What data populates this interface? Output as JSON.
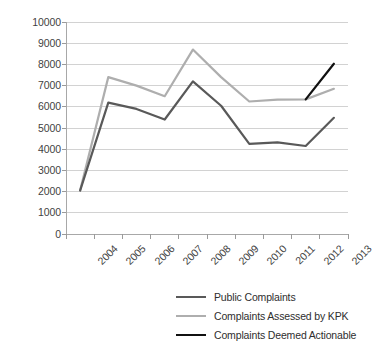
{
  "chart_data": {
    "type": "line",
    "title": "",
    "subtitle": "",
    "xlabel": "",
    "ylabel": "",
    "categories": [
      "2004",
      "2005",
      "2006",
      "2007",
      "2008",
      "2009",
      "2010",
      "2011",
      "2012",
      "2013"
    ],
    "ylim": [
      0,
      10000
    ],
    "ytick_step": 1000,
    "yticks": [
      "10000",
      "9000",
      "8000",
      "7000",
      "6000",
      "5000",
      "4000",
      "3000",
      "2000",
      "1000",
      "0"
    ],
    "ytick_values": [
      10000,
      9000,
      8000,
      7000,
      6000,
      5000,
      4000,
      3000,
      2000,
      1000,
      0
    ],
    "grid": "horizontal",
    "legend_position": "bottom",
    "series": [
      {
        "name": "Public Complaints",
        "color": "#595959",
        "width": 2.2,
        "values": [
          2050,
          6200,
          5900,
          5400,
          7200,
          6050,
          4250,
          4320,
          4150,
          5480
        ]
      },
      {
        "name": "Complaints Assessed by KPK",
        "color": "#aeaeae",
        "width": 2.2,
        "values": [
          2050,
          7400,
          7000,
          6500,
          8700,
          7400,
          6250,
          6340,
          6350,
          6850
        ]
      },
      {
        "name": "Complaints Deemed Actionable",
        "color": "#111111",
        "width": 2.2,
        "values": [
          null,
          null,
          null,
          null,
          null,
          null,
          null,
          null,
          6350,
          8030
        ]
      }
    ]
  },
  "legend": {
    "items": [
      {
        "label": "Public Complaints",
        "color": "#595959"
      },
      {
        "label": "Complaints Assessed by KPK",
        "color": "#aeaeae"
      },
      {
        "label": "Complaints Deemed Actionable",
        "color": "#111111"
      }
    ]
  },
  "axes": {
    "axis_color": "#a8a8a8",
    "grid_color": "#d2d2d2",
    "tick_color": "#9a9a9a"
  }
}
